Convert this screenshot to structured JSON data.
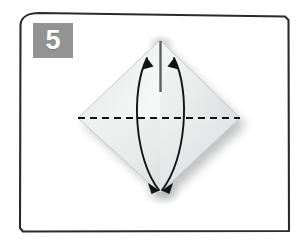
{
  "illustration": {
    "type": "origami-instruction-diagram",
    "step_number": "5",
    "background_color": "#ffffff",
    "frame": {
      "name": "panel-border",
      "stroke_color": "#2b2b2b",
      "corner_style": "rounded-hand-drawn"
    },
    "badge": {
      "label": "5",
      "background_color": "#939393",
      "text_color": "#ffffff"
    },
    "paper": {
      "shape": "diamond",
      "fill_light": "#f2f3f3",
      "fill_mid": "#e6e8e8",
      "fill_shade": "#d8dadb",
      "edge_color": "#c9cccd",
      "shadow_color": "#9a9b9c",
      "vertices": {
        "top": [
          160,
          40
        ],
        "right": [
          240,
          118
        ],
        "bottom": [
          160,
          193
        ],
        "left": [
          78,
          118
        ]
      }
    },
    "fold_line": {
      "name": "valley-fold-dashed-line",
      "style": "dashed",
      "color": "#1a1a1a",
      "from": [
        78,
        118
      ],
      "to": [
        240,
        118
      ]
    },
    "center_crease": {
      "name": "vertical-center-crease",
      "color": "#4a4a4a",
      "from": [
        160,
        40
      ],
      "to": [
        160,
        193
      ]
    },
    "arrows": [
      {
        "name": "left-fold-arrow",
        "direction": "up-and-down",
        "color": "#1a1a1a",
        "heads": [
          "top",
          "bottom"
        ]
      },
      {
        "name": "right-fold-arrow",
        "direction": "up-and-down",
        "color": "#1a1a1a",
        "heads": [
          "top",
          "bottom"
        ]
      }
    ]
  }
}
